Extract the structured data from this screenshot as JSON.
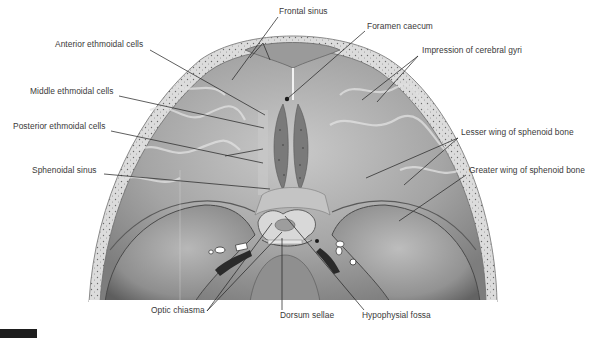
{
  "figure": {
    "type": "anatomical-illustration",
    "colors": {
      "background": "#ffffff",
      "label_text": "#3a3a3a",
      "leader_line": "#2a2a2a",
      "bone_light": "#d9d9d9",
      "bone_mid": "#a8a8a8",
      "bone_dark": "#6e6e6e",
      "figure_tab": "#1e1e1e"
    }
  },
  "labels": [
    {
      "id": "frontal-sinus",
      "text": "Frontal sinus",
      "x": 279,
      "y": 11
    },
    {
      "id": "foramen-caecum",
      "text": "Foramen caecum",
      "x": 367,
      "y": 26
    },
    {
      "id": "anterior-ethmoidal-cells",
      "text": "Anterior ethmoidal cells",
      "x": 55,
      "y": 44
    },
    {
      "id": "impression-of-cerebral-gyri",
      "text": "Impression of cerebral gyri",
      "x": 422,
      "y": 50
    },
    {
      "id": "middle-ethmoidal-cells",
      "text": "Middle ethmoidal cells",
      "x": 30,
      "y": 91
    },
    {
      "id": "posterior-ethmoidal-cells",
      "text": "Posterior ethmoidal cells",
      "x": 13,
      "y": 126
    },
    {
      "id": "lesser-wing-of-sphenoid-bone",
      "text": "Lesser wing of sphenoid bone",
      "x": 461,
      "y": 132
    },
    {
      "id": "sphenoidal-sinus",
      "text": "Sphenoidal sinus",
      "x": 32,
      "y": 170
    },
    {
      "id": "greater-wing-of-sphenoid-bone",
      "text": "Greater wing of sphenoid bone",
      "x": 469,
      "y": 170
    },
    {
      "id": "optic-chiasma",
      "text": "Optic chiasma",
      "x": 151,
      "y": 310
    },
    {
      "id": "dorsum-sellae",
      "text": "Dorsum sellae",
      "x": 280,
      "y": 315
    },
    {
      "id": "hypophysial-fossa",
      "text": "Hypophysial fossa",
      "x": 362,
      "y": 315
    }
  ],
  "leaders": [
    {
      "for": "frontal-sinus",
      "points": [
        [
          278,
          17
        ],
        [
          232,
          80
        ]
      ]
    },
    {
      "for": "frontal-sinus",
      "points": [
        [
          263,
          43
        ],
        [
          270,
          60
        ]
      ]
    },
    {
      "for": "frontal-sinus",
      "points": [
        [
          263,
          43
        ],
        [
          250,
          58
        ]
      ]
    },
    {
      "for": "foramen-caecum",
      "points": [
        [
          365,
          31
        ],
        [
          287,
          99
        ]
      ]
    },
    {
      "for": "anterior-ethmoidal-cells",
      "points": [
        [
          150,
          50
        ],
        [
          265,
          115
        ]
      ]
    },
    {
      "for": "impression-of-cerebral-gyri",
      "points": [
        [
          418,
          56
        ],
        [
          362,
          100
        ]
      ]
    },
    {
      "for": "impression-of-cerebral-gyri",
      "points": [
        [
          418,
          56
        ],
        [
          377,
          102
        ]
      ]
    },
    {
      "for": "middle-ethmoidal-cells",
      "points": [
        [
          119,
          96
        ],
        [
          264,
          128
        ]
      ]
    },
    {
      "for": "posterior-ethmoidal-cells",
      "points": [
        [
          111,
          131
        ],
        [
          263,
          163
        ]
      ]
    },
    {
      "for": "posterior-ethmoidal-cells",
      "points": [
        [
          225,
          156
        ],
        [
          263,
          149
        ]
      ]
    },
    {
      "for": "lesser-wing-of-sphenoid-bone",
      "points": [
        [
          458,
          138
        ],
        [
          366,
          178
        ]
      ]
    },
    {
      "for": "lesser-wing-of-sphenoid-bone",
      "points": [
        [
          458,
          138
        ],
        [
          404,
          185
        ]
      ]
    },
    {
      "for": "sphenoidal-sinus",
      "points": [
        [
          104,
          174
        ],
        [
          270,
          189
        ]
      ]
    },
    {
      "for": "greater-wing-of-sphenoid-bone",
      "points": [
        [
          466,
          175
        ],
        [
          399,
          221
        ]
      ]
    },
    {
      "for": "optic-chiasma",
      "points": [
        [
          207,
          311
        ],
        [
          272,
          223
        ]
      ]
    },
    {
      "for": "optic-chiasma",
      "points": [
        [
          207,
          311
        ],
        [
          282,
          232
        ]
      ]
    },
    {
      "for": "dorsum-sellae",
      "points": [
        [
          282,
          310
        ],
        [
          282,
          238
        ]
      ]
    },
    {
      "for": "hypophysial-fossa",
      "points": [
        [
          364,
          310
        ],
        [
          285,
          216
        ]
      ]
    }
  ],
  "figure_tab": {
    "visible": true
  }
}
